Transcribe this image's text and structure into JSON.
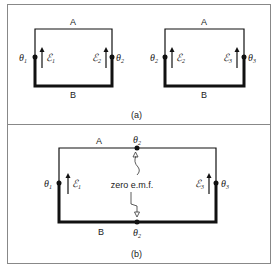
{
  "figure": {
    "panel_a": {
      "caption": "(a)",
      "left_circuit": {
        "top_label": "A",
        "bottom_label": "B",
        "left_junction": {
          "symbol": "θ",
          "sub": "1"
        },
        "right_junction": {
          "symbol": "θ",
          "sub": "2"
        },
        "left_emf": {
          "symbol": "ℰ",
          "sub": "1"
        },
        "right_emf": {
          "symbol": "ℰ",
          "sub": "2"
        }
      },
      "right_circuit": {
        "top_label": "A",
        "bottom_label": "B",
        "left_junction": {
          "symbol": "θ",
          "sub": "2"
        },
        "right_junction": {
          "symbol": "θ",
          "sub": "3"
        },
        "left_emf": {
          "symbol": "ℰ",
          "sub": "2"
        },
        "right_emf": {
          "symbol": "ℰ",
          "sub": "3"
        }
      }
    },
    "panel_b": {
      "caption": "(b)",
      "top_label": "A",
      "bottom_label": "B",
      "left_junction": {
        "symbol": "θ",
        "sub": "1"
      },
      "right_junction": {
        "symbol": "θ",
        "sub": "3"
      },
      "left_emf": {
        "symbol": "ℰ",
        "sub": "1"
      },
      "right_emf": {
        "symbol": "ℰ",
        "sub": "3"
      },
      "middle_top_junction": {
        "symbol": "θ",
        "sub": "2"
      },
      "middle_bottom_junction": {
        "symbol": "θ",
        "sub": "2"
      },
      "annotation": "zero e.m.f."
    }
  }
}
